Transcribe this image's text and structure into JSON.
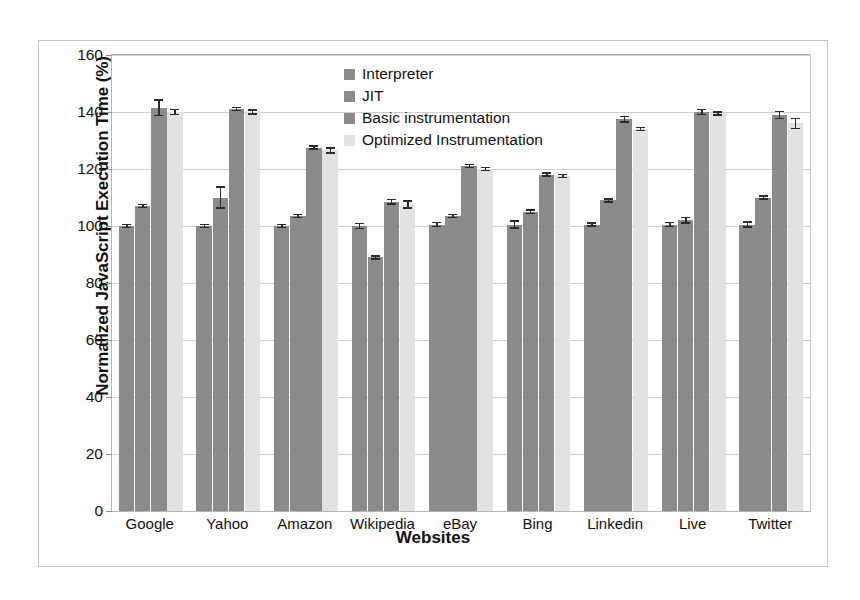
{
  "chart_data": {
    "type": "bar",
    "title": "",
    "subtitle": "",
    "xlabel": "Websites",
    "ylabel": "Normalized JavaScript Execution Time (%)",
    "ylim": [
      0,
      160
    ],
    "ytick_step": 20,
    "yticks": [
      0,
      20,
      40,
      60,
      80,
      100,
      120,
      140,
      160
    ],
    "ytick_labels": [
      "0",
      "20",
      "40",
      "60",
      "80",
      "100",
      "120",
      "140",
      "160"
    ],
    "grid": true,
    "grid_axis": "y",
    "legend_position": "upper center inside",
    "categories": [
      "Google",
      "Yahoo",
      "Amazon",
      "Wikipedia",
      "eBay",
      "Bing",
      "Linkedin",
      "Live",
      "Twitter"
    ],
    "series": [
      {
        "name": "Interpreter",
        "color": "#8b8b8b",
        "values": [
          100,
          100,
          100,
          100,
          100.5,
          100.5,
          100.5,
          100.5,
          100.5
        ],
        "errors": [
          0.8,
          0.8,
          0.8,
          1.2,
          1.0,
          1.5,
          0.8,
          1.0,
          1.2
        ]
      },
      {
        "name": "JIT",
        "color": "#8b8b8b",
        "values": [
          107,
          110,
          103.5,
          89,
          103.5,
          105,
          109,
          102,
          110
        ],
        "errors": [
          0.8,
          4.0,
          0.8,
          0.8,
          0.8,
          0.8,
          0.8,
          1.2,
          0.8
        ]
      },
      {
        "name": "Basic instrumentation",
        "color": "#8b8b8b",
        "values": [
          141.5,
          141,
          127.5,
          108.5,
          121,
          118,
          137.5,
          140,
          139
        ],
        "errors": [
          3.0,
          0.8,
          0.8,
          1.0,
          0.8,
          0.8,
          1.2,
          1.2,
          1.5
        ]
      },
      {
        "name": "Optimized Instrumentation",
        "color": "#e2e2e2",
        "values": [
          140,
          140,
          126.5,
          107.5,
          120,
          117.5,
          134,
          139.5,
          136
        ],
        "errors": [
          1.2,
          1.0,
          1.2,
          1.5,
          0.8,
          0.8,
          0.8,
          0.8,
          2.0
        ]
      }
    ]
  }
}
